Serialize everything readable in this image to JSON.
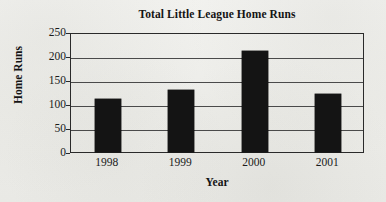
{
  "chart_data": {
    "type": "bar",
    "title": "Total Little League Home Runs",
    "xlabel": "Year",
    "ylabel": "Home Runs",
    "categories": [
      "1998",
      "1999",
      "2000",
      "2001"
    ],
    "values": [
      110,
      130,
      210,
      120
    ],
    "ylim": [
      0,
      250
    ],
    "ytick_labels": [
      "0",
      "50",
      "100",
      "150",
      "200",
      "250"
    ],
    "ytick_values": [
      0,
      50,
      100,
      150,
      200,
      250
    ],
    "grid": true,
    "grid_axis": "y",
    "legend": false,
    "legend_position": "none",
    "bar_color": "#141414",
    "axis_color": "#2a2a2a",
    "grid_color": "#4a4a4a",
    "background_color": "#efefec"
  }
}
